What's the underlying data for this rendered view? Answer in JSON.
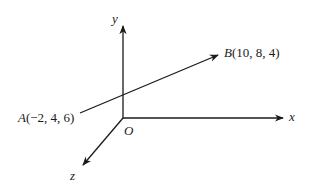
{
  "diagram": {
    "type": "3d-coordinate-axes-with-vector",
    "colors": {
      "ink": "#1a1a1a",
      "background": "#ffffff"
    },
    "axes": {
      "x_label": "x",
      "y_label": "y",
      "z_label": "z",
      "origin_label": "O"
    },
    "points": {
      "A": {
        "name": "A",
        "coords": "(−2, 4, 6)",
        "x": -2,
        "y": 4,
        "z": 6
      },
      "B": {
        "name": "B",
        "coords": "(10, 8, 4)",
        "x": 10,
        "y": 8,
        "z": 4
      }
    },
    "vector": {
      "from": "A",
      "to": "B"
    }
  }
}
